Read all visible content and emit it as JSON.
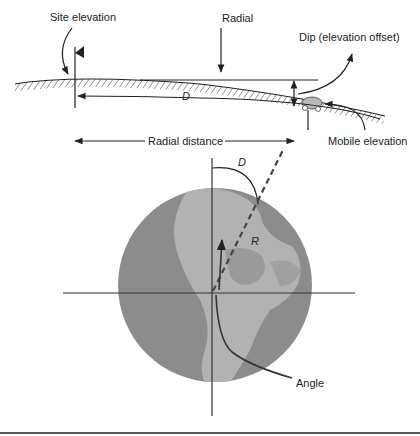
{
  "figure": {
    "top_panel": {
      "labels": {
        "site_elevation": "Site elevation",
        "radial": "Radial",
        "dip": "Dip (elevation offset)",
        "mobile_elevation": "Mobile elevation",
        "distance_symbol": "D",
        "radial_distance": "Radial distance"
      }
    },
    "bottom_panel": {
      "labels": {
        "azimuth_symbol": "D",
        "radius_symbol": "R",
        "angle": "Angle"
      }
    },
    "colors": {
      "ink": "#222222",
      "globe_ocean": "#8c8c8c",
      "globe_land": "#b4b4b4",
      "background": "#ffffff"
    }
  }
}
